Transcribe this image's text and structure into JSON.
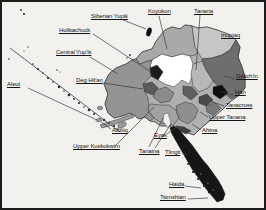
{
  "map": {
    "labels": [
      {
        "id": "siberian-yupik",
        "text": "Siberian Yupik"
      },
      {
        "id": "koyukon",
        "text": "Koyukon"
      },
      {
        "id": "tanana",
        "text": "Tanana"
      },
      {
        "id": "inupiaq",
        "text": "Inupiaq"
      },
      {
        "id": "holikachuck",
        "text": "Holikachuck"
      },
      {
        "id": "central-yupik",
        "text": "Central Yup'ik"
      },
      {
        "id": "deg-hitan",
        "text": "Deg Hit'an"
      },
      {
        "id": "gwichin",
        "text": "Gwich'in"
      },
      {
        "id": "han",
        "text": "Han"
      },
      {
        "id": "tanacross",
        "text": "Tanacross"
      },
      {
        "id": "upper-tanana",
        "text": "Upper Tanana"
      },
      {
        "id": "ahtna",
        "text": "Ahtna"
      },
      {
        "id": "aleut",
        "text": "Aleut"
      },
      {
        "id": "alutiiq",
        "text": "Alutiiq"
      },
      {
        "id": "eyak",
        "text": "Eyak"
      },
      {
        "id": "upper-kuskokwim",
        "text": "Upper Kuskokwim"
      },
      {
        "id": "tanaina",
        "text": "Tanaina"
      },
      {
        "id": "tlingit",
        "text": "Tlingit"
      },
      {
        "id": "haida",
        "text": "Haida"
      },
      {
        "id": "tsimshian",
        "text": "Tsimshian"
      }
    ],
    "colors": {
      "paper": "#f2f1ee",
      "frame": "#1d1d1d",
      "land_base": "#b0b0b0",
      "outline": "#2e2e2e",
      "leader": "#3a3a3a",
      "inupiaq_west": "#a9a9a9",
      "north_slope": "#c6c6c6",
      "gwichin": "#6e6e6e",
      "koyukon": "#ffffff",
      "tanana": "#b8b8b8",
      "interior_patch": "#5f5f5f",
      "holikachuk": "#1c1c1c",
      "deg_hitan": "#5a5a5a",
      "central_yupik": "#949494",
      "upper_kuskokwim": "#8b8b8b",
      "tanaina": "#a2a2a2",
      "ahtna": "#8f8f8f",
      "tanacross": "#4a4a4a",
      "upper_tanana": "#787878",
      "han": "#0f0f0f",
      "eyak": "#3f3f3f",
      "tlingit": "#161616",
      "alutiiq": "#9b9b9b",
      "siberian_yupik_island": "#111111",
      "aleut_dots": "#2a2a2a",
      "sea_speck": "#e8e8e6"
    }
  }
}
